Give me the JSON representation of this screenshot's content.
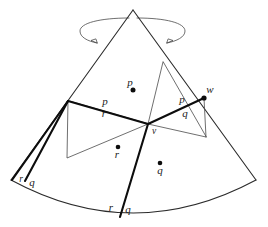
{
  "figure": {
    "background_color": "#ffffff",
    "ink_color": "#0d0d0d",
    "thin_color": "#4a4a4a",
    "width": 268,
    "height": 227
  },
  "labels": {
    "p_top": "p",
    "p_left_edge": "p",
    "r_left_edge": "r",
    "p_right_edge": "p",
    "q_right_edge": "q",
    "r_center": "r",
    "q_center": "q",
    "r_bottom_left": "r",
    "q_bottom_left": "q",
    "r_bottom_mid": "r",
    "q_bottom_mid": "q",
    "vertex_v": "v",
    "vertex_w": "w"
  },
  "points": {
    "apex": {
      "x": 133,
      "y": 10
    },
    "v": {
      "x": 148,
      "y": 124
    },
    "w": {
      "x": 204,
      "y": 98
    },
    "dot_p": {
      "x": 133,
      "y": 90
    },
    "dot_r": {
      "x": 118,
      "y": 147
    },
    "dot_q": {
      "x": 160,
      "y": 163
    }
  },
  "rotation_arrow": {
    "name": "rotation-indicator",
    "direction": "clockwise-about-axis",
    "ellipse_center": {
      "x": 132,
      "y": 31
    },
    "ellipse_rx": 53,
    "ellipse_ry": 14
  }
}
